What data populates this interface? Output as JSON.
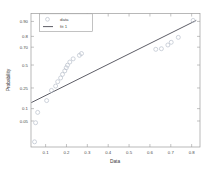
{
  "chart_data": {
    "type": "scatter",
    "title": "",
    "xlabel": "Data",
    "ylabel": "Probability",
    "grid": false,
    "legend_position": "top-left",
    "xlim": [
      0.03,
      0.84
    ],
    "xticks": [
      0.1,
      0.2,
      0.3,
      0.4,
      0.5,
      0.6,
      0.7,
      0.8
    ],
    "xticklabels": [
      "0.1",
      "0.2",
      "0.3",
      "0.4",
      "0.5",
      "0.6",
      "0.7",
      "0.8"
    ],
    "yticks": [
      0.05,
      0.1,
      0.25,
      0.5,
      0.7,
      0.8,
      0.9
    ],
    "yticklabels": [
      "0.05",
      "0.1",
      "0.25",
      "0.5",
      "0.70",
      "0.8",
      "0.90"
    ],
    "yscale": "probability",
    "series": [
      {
        "name": "data",
        "type": "scatter",
        "marker": "circle",
        "color": "#b9c0cc",
        "x": [
          0.047,
          0.052,
          0.062,
          0.105,
          0.128,
          0.148,
          0.158,
          0.172,
          0.181,
          0.192,
          0.199,
          0.205,
          0.216,
          0.232,
          0.262,
          0.272,
          0.628,
          0.655,
          0.686,
          0.702,
          0.736,
          0.807
        ],
        "y": [
          0.012,
          0.045,
          0.082,
          0.148,
          0.228,
          0.268,
          0.312,
          0.352,
          0.392,
          0.432,
          0.468,
          0.498,
          0.535,
          0.572,
          0.612,
          0.632,
          0.678,
          0.684,
          0.722,
          0.748,
          0.792,
          0.905
        ]
      },
      {
        "name": "fit 1",
        "type": "line",
        "color": "#4b4b55",
        "x": [
          0.032,
          0.822
        ],
        "y": [
          0.135,
          0.905
        ]
      }
    ]
  },
  "legend": {
    "entries": [
      {
        "label": "data",
        "marker": "circle"
      },
      {
        "label": "fit 1",
        "marker": "line"
      }
    ]
  },
  "axes": {
    "x_title": "Data",
    "y_title": "Probability"
  }
}
